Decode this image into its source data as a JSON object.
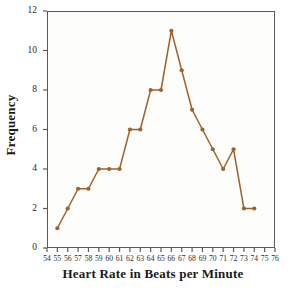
{
  "chart_data": {
    "type": "line",
    "title": "",
    "xlabel": "Heart Rate in Beats per Minute",
    "ylabel": "Frequency",
    "x": [
      55,
      56,
      57,
      58,
      59,
      60,
      61,
      62,
      63,
      64,
      65,
      66,
      67,
      68,
      69,
      70,
      71,
      72,
      73,
      74
    ],
    "values": [
      1,
      2,
      3,
      3,
      4,
      4,
      4,
      6,
      6,
      8,
      8,
      11,
      9,
      7,
      6,
      5,
      4,
      5,
      2,
      2
    ],
    "series": [
      {
        "name": "Frequency",
        "values": [
          1,
          2,
          3,
          3,
          4,
          4,
          4,
          6,
          6,
          8,
          8,
          11,
          9,
          7,
          6,
          5,
          4,
          5,
          2,
          2
        ]
      }
    ],
    "xlim": [
      54,
      76
    ],
    "ylim": [
      0,
      12
    ],
    "xticks": [
      54,
      55,
      56,
      57,
      58,
      59,
      60,
      61,
      62,
      63,
      64,
      65,
      66,
      67,
      68,
      69,
      70,
      71,
      72,
      73,
      74,
      75,
      76
    ],
    "xtick_labels": [
      "54",
      "55",
      "56",
      "57",
      "58",
      "59",
      "60",
      "61",
      "62",
      "63",
      "64",
      "65",
      "66",
      "67",
      "68",
      "69",
      "70",
      "71",
      "72",
      "73",
      "74",
      "75",
      "76"
    ],
    "yticks": [
      0,
      2,
      4,
      6,
      8,
      10,
      12
    ],
    "ytick_labels": [
      "0",
      "2",
      "4",
      "6",
      "8",
      "10",
      "12"
    ],
    "grid": false,
    "legend": "none",
    "marker": "circle",
    "line_color": "#a0622d",
    "marker_color": "#a0622d",
    "axis_color": "#5a5a5e",
    "background_color": "#fdfdfb"
  }
}
